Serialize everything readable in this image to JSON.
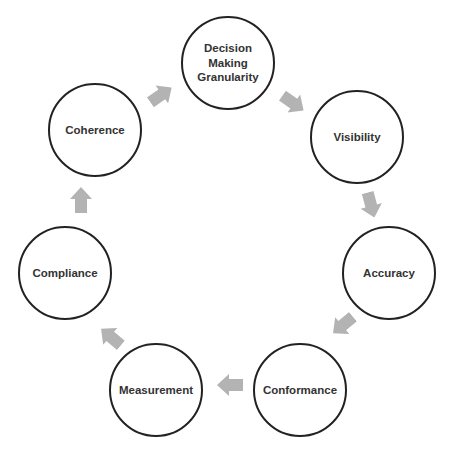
{
  "diagram": {
    "type": "cycle",
    "arrow_color": "#b3b3b3",
    "circle_stroke": "#222222",
    "nodes": [
      {
        "label": "Decision\nMaking\nGranularity",
        "cx": 228,
        "cy": 63
      },
      {
        "label": "Visibility",
        "cx": 357,
        "cy": 137
      },
      {
        "label": "Accuracy",
        "cx": 389,
        "cy": 273
      },
      {
        "label": "Conformance",
        "cx": 300,
        "cy": 390
      },
      {
        "label": "Measurement",
        "cx": 156,
        "cy": 390
      },
      {
        "label": "Compliance",
        "cx": 65,
        "cy": 273
      },
      {
        "label": "Coherence",
        "cx": 95,
        "cy": 130
      }
    ],
    "edges": [
      {
        "from": "Coherence",
        "to": "Decision Making Granularity"
      },
      {
        "from": "Decision Making Granularity",
        "to": "Visibility"
      },
      {
        "from": "Visibility",
        "to": "Accuracy"
      },
      {
        "from": "Accuracy",
        "to": "Conformance"
      },
      {
        "from": "Conformance",
        "to": "Measurement"
      },
      {
        "from": "Measurement",
        "to": "Compliance"
      },
      {
        "from": "Compliance",
        "to": "Coherence"
      }
    ]
  }
}
